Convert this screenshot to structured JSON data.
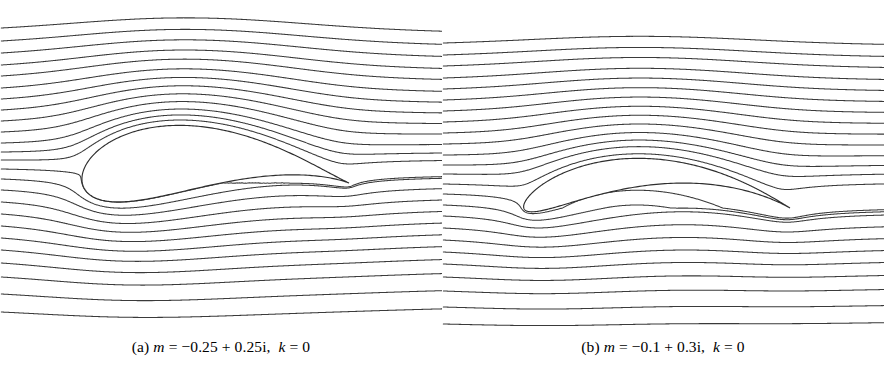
{
  "figure": {
    "type": "streamline-plot-pair",
    "background_color": "#ffffff",
    "stroke_color": "#3a3a3a"
  },
  "panels": [
    {
      "id": "panel-a",
      "caption": {
        "label": "(a)",
        "var_m": "m",
        "eq1": "=",
        "value_m": "−0.25 + 0.25i,",
        "var_k": "k",
        "eq2": "=",
        "value_k": "0",
        "full_text": "(a) m = −0.25 + 0.25i,  k = 0"
      }
    },
    {
      "id": "panel-b",
      "caption": {
        "label": "(b)",
        "var_m": "m",
        "eq1": "=",
        "value_m": "−0.1 + 0.3i,",
        "var_k": "k",
        "eq2": "=",
        "value_k": "0",
        "full_text": "(b) m = −0.1 + 0.3i,  k = 0"
      }
    }
  ],
  "chart_data": {
    "type": "line",
    "title": "",
    "subtitle": "",
    "xlabel": "",
    "ylabel": "",
    "grid": false,
    "legend_position": "none",
    "charts": [
      {
        "id": "panel-a",
        "type": "line",
        "caption": "(a) m = −0.25 + 0.25i, k = 0",
        "parameters": {
          "m_real": -0.25,
          "m_imag": 0.25,
          "m_text": "-0.25+0.25i",
          "k": 0
        },
        "domain": {
          "x": [
            38,
            422
          ],
          "y": [
            28,
            326
          ]
        },
        "airfoil": {
          "shape": "thick cambered Joukowski airfoil",
          "leading_edge": [
            128,
            180
          ],
          "trailing_edge": [
            322,
            187
          ],
          "chord_px": 194,
          "upper_crest": [
            190,
            146
          ],
          "lower_crest": [
            205,
            206
          ],
          "max_thickness_px": 60
        },
        "streamlines": {
          "count": 25,
          "left_edge_y": [
            28,
            41,
            53,
            65,
            76,
            88,
            99,
            110,
            121,
            132,
            143,
            152,
            160,
            169,
            179,
            190,
            202,
            214,
            226,
            238,
            250,
            263,
            277,
            294,
            312
          ],
          "stagnation_streamline_index": 13,
          "direction": "left-to-right"
        }
      },
      {
        "id": "panel-b",
        "type": "line",
        "caption": "(b) m = −0.1 + 0.3i, k = 0",
        "parameters": {
          "m_real": -0.1,
          "m_imag": 0.3,
          "m_text": "-0.1+0.3i",
          "k": 0
        },
        "domain": {
          "x": [
            462,
            853
          ],
          "y": [
            43,
            330
          ]
        },
        "airfoil": {
          "shape": "thin highly cambered arc airfoil",
          "leading_edge": [
            553,
            208
          ],
          "trailing_edge": [
            752,
            208
          ],
          "chord_px": 199,
          "camber_peak": [
            652,
            174
          ],
          "max_thickness_px": 16
        },
        "streamlines": {
          "count": 25,
          "left_edge_y": [
            43,
            55,
            66,
            78,
            89,
            100,
            111,
            122,
            133,
            144,
            155,
            165,
            174,
            184,
            194,
            205,
            216,
            228,
            240,
            252,
            264,
            277,
            291,
            307,
            324
          ],
          "stagnation_streamline_index": 13,
          "direction": "left-to-right"
        }
      }
    ]
  }
}
